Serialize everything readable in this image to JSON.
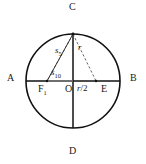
{
  "figure": {
    "type": "geometric-construction",
    "canvas": {
      "width": 146,
      "height": 164,
      "background": "#ffffff"
    },
    "colors": {
      "stroke": "#111111",
      "circle": "#111111",
      "dashed": "#555555",
      "text": "#1a1a1a"
    },
    "circle": {
      "cx": 73,
      "cy": 81,
      "r": 47
    },
    "points": [
      {
        "id": "A",
        "label": "A",
        "x": 26,
        "y": 81,
        "label_x": 7,
        "label_y": 75
      },
      {
        "id": "B",
        "label": "B",
        "x": 120,
        "y": 81,
        "label_x": 130,
        "label_y": 75
      },
      {
        "id": "C",
        "label": "C",
        "x": 73,
        "y": 34,
        "label_x": 69,
        "label_y": 3
      },
      {
        "id": "D",
        "label": "D",
        "x": 73,
        "y": 128,
        "label_x": 69,
        "label_y": 147
      },
      {
        "id": "O",
        "label": "O",
        "x": 73,
        "y": 81,
        "label_x": 66,
        "label_y": 84
      },
      {
        "id": "E",
        "label": "E",
        "x": 96,
        "y": 81,
        "label_x": 101,
        "label_y": 84
      },
      {
        "id": "F",
        "label": "F",
        "sub": "1",
        "x": 47,
        "y": 81,
        "label_x": 38,
        "label_y": 84
      }
    ],
    "segments": [
      {
        "name": "diameter-ab",
        "from": "A",
        "to": "B",
        "style": "solid"
      },
      {
        "name": "diameter-cd",
        "from": "C",
        "to": "D",
        "style": "solid"
      },
      {
        "name": "segment-fc",
        "from": "F",
        "to": "C",
        "style": "solid"
      },
      {
        "name": "chord-cf-dashed",
        "from": "C",
        "to": "F",
        "style": "dashed"
      },
      {
        "name": "chord-ce-dashed",
        "from": "C",
        "to": "E",
        "style": "dashed"
      }
    ],
    "measure_labels": [
      {
        "name": "radius-label",
        "base": "r",
        "sub": "",
        "x": 78,
        "y": 45
      },
      {
        "name": "half-radius-label",
        "base": "r",
        "sub": "",
        "suffix": "/2",
        "x": 78,
        "y": 84
      },
      {
        "name": "pentagon-side-label",
        "base": "s",
        "sub": "5",
        "x": 56,
        "y": 48
      },
      {
        "name": "decagon-side-label",
        "base": "s",
        "sub": "10",
        "x": 52,
        "y": 69
      }
    ]
  }
}
